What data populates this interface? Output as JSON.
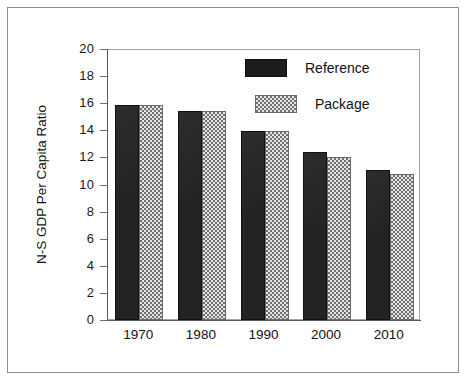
{
  "figure": {
    "background_color": "#ffffff",
    "border_color": "#8d8d8d"
  },
  "chart_data": {
    "type": "bar",
    "title": "",
    "xlabel": "",
    "ylabel": "N-S GDP Per Capita Ratio",
    "categories": [
      "1970",
      "1980",
      "1990",
      "2000",
      "2010"
    ],
    "series": [
      {
        "name": "Reference",
        "color": "#1c1c1c",
        "pattern": "solid",
        "values": [
          15.85,
          15.45,
          13.95,
          12.4,
          11.05
        ]
      },
      {
        "name": "Package",
        "color": "#c0c0c0",
        "pattern": "checker",
        "values": [
          15.85,
          15.45,
          13.95,
          12.0,
          10.8
        ]
      }
    ],
    "ylim": [
      0,
      20
    ],
    "ytick_step": 2,
    "yticks": [
      "0",
      "2",
      "4",
      "6",
      "8",
      "10",
      "12",
      "14",
      "16",
      "18",
      "20"
    ],
    "grid": false,
    "legend_position": "upper-right-inside"
  },
  "legend": {
    "entries": [
      {
        "label": "Reference",
        "swatch": "solid-black-swatch"
      },
      {
        "label": "Package",
        "swatch": "checkered-gray-swatch"
      }
    ]
  },
  "axes": {
    "y_title": "N-S GDP Per Capita Ratio"
  }
}
